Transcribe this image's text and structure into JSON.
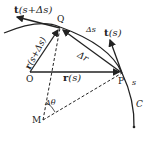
{
  "labels": {
    "t_s_ds": "t(s+Δs)",
    "t_s_ds_bold": "t",
    "t_s_ds_arg": "(s+Δs)",
    "Q": "Q",
    "delta_s": "Δs",
    "t_s_bold": "t",
    "t_s_arg": "(s)",
    "r_s_ds_bold": "r",
    "r_s_ds_arg": "(s+Δs)",
    "delta_r": "Δr",
    "O": "O",
    "r_s_bold": "r",
    "r_s_arg": "(s)",
    "P": "P",
    "s": "s",
    "delta_theta": "Δθ",
    "M": "M",
    "C": "C"
  },
  "colors": {
    "ink": "#222222",
    "background": "#ffffff"
  }
}
